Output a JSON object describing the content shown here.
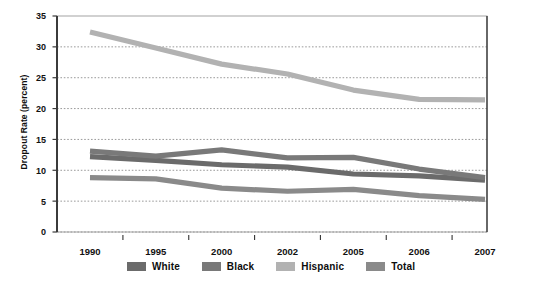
{
  "chart_data": {
    "type": "line",
    "title": "",
    "xlabel": "",
    "ylabel": "Dropout Rate (percent)",
    "categories": [
      "1990",
      "1995",
      "2000",
      "2002",
      "2005",
      "2006",
      "2007"
    ],
    "ylim": [
      0,
      35
    ],
    "yticks": [
      0,
      5,
      10,
      15,
      20,
      25,
      30,
      35
    ],
    "ytick_labels": [
      "0",
      "5",
      "10",
      "15",
      "20",
      "25",
      "30",
      "35"
    ],
    "grid": true,
    "grid_style": "dotted-horizontal",
    "legend_position": "bottom",
    "series": [
      {
        "name": "White",
        "color": "#6b6b6b",
        "values": [
          12.2,
          11.6,
          10.9,
          10.5,
          9.4,
          9.1,
          8.4
        ]
      },
      {
        "name": "Black",
        "color": "#797979",
        "values": [
          13.1,
          12.3,
          13.3,
          12.0,
          12.1,
          10.2,
          8.8
        ]
      },
      {
        "name": "Hispanic",
        "color": "#b2b2b2",
        "values": [
          32.4,
          29.8,
          27.2,
          25.6,
          23.0,
          21.5,
          21.4
        ]
      },
      {
        "name": "Total",
        "color": "#8a8a8a",
        "values": [
          8.8,
          8.6,
          7.1,
          6.6,
          6.9,
          5.9,
          5.3
        ]
      }
    ]
  },
  "legend": {
    "items": [
      {
        "label": "White",
        "color": "#6b6b6b"
      },
      {
        "label": "Black",
        "color": "#797979"
      },
      {
        "label": "Hispanic",
        "color": "#b2b2b2"
      },
      {
        "label": "Total",
        "color": "#8a8a8a"
      }
    ]
  },
  "axes": {
    "y_title": "Dropout Rate (percent)"
  },
  "colors": {
    "plot_border": "#3b3b3b",
    "axis_line": "#3b3b3b",
    "gridline": "#8f8f8f",
    "background": "#ffffff",
    "text": "#111111"
  }
}
